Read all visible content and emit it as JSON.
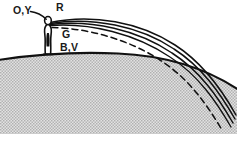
{
  "figure": {
    "name": "atmospheric-refraction-dispersion-diagram",
    "width": 237,
    "height": 145,
    "background_color": "#ffffff",
    "ink_color": "#111111",
    "ground_fill_color": "#c9c9c9",
    "ground_pattern": "stipple-dots"
  },
  "labels": {
    "observer": "O,Y",
    "red_ray": "R",
    "green_ray": "G",
    "blue_violet_ray": "B,V"
  },
  "elements": {
    "observer_figure": "standing-person-silhouette",
    "ground": "curved-earth-surface",
    "leader_line": "label-leader-from-O,Y-to-head"
  },
  "rays": [
    {
      "id": "ray-outer",
      "style": "solid",
      "label": "R"
    },
    {
      "id": "ray-middle",
      "style": "solid",
      "label": "G"
    },
    {
      "id": "ray-inner",
      "style": "solid",
      "label": "B,V"
    },
    {
      "id": "ray-dashed",
      "style": "dashed",
      "label": "B,V"
    }
  ]
}
